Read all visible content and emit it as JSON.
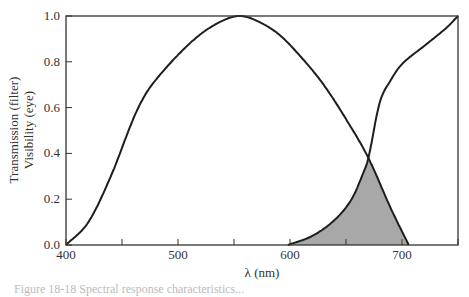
{
  "chart_data": {
    "type": "line",
    "title": "",
    "xlabel": "λ (nm)",
    "ylabel_line1": "Transmission (filter)",
    "ylabel_line2": "Visibility (eye)",
    "xlim": [
      400,
      750
    ],
    "ylim": [
      0.0,
      1.0
    ],
    "x_ticks": [
      400,
      450,
      500,
      550,
      600,
      650,
      700,
      750
    ],
    "x_tick_labels": [
      "400",
      "500",
      "600",
      "700"
    ],
    "x_tick_label_values": [
      400,
      500,
      600,
      700
    ],
    "y_ticks": [
      0.0,
      0.2,
      0.4,
      0.6,
      0.8,
      1.0
    ],
    "y_tick_labels": [
      "0.0",
      "0.2",
      "0.4",
      "0.6",
      "0.8",
      "1.0"
    ],
    "grid": false,
    "legend": null,
    "series": [
      {
        "name": "Visibility (eye)",
        "x": [
          400,
          420,
          440,
          460,
          470,
          480,
          500,
          520,
          540,
          555,
          570,
          590,
          610,
          630,
          650,
          670,
          690,
          706
        ],
        "values": [
          0.0,
          0.1,
          0.3,
          0.55,
          0.65,
          0.72,
          0.83,
          0.92,
          0.98,
          1.0,
          0.98,
          0.92,
          0.82,
          0.7,
          0.55,
          0.38,
          0.16,
          0.0
        ]
      },
      {
        "name": "Transmission (filter)",
        "x": [
          598,
          620,
          640,
          655,
          665,
          670,
          680,
          690,
          700,
          720,
          740,
          750
        ],
        "values": [
          0.0,
          0.04,
          0.11,
          0.2,
          0.31,
          0.38,
          0.62,
          0.72,
          0.79,
          0.87,
          0.95,
          1.0
        ]
      }
    ],
    "annotations": [
      {
        "type": "shaded_region",
        "description": "Overlap area under both curves (min of eye and filter), ~598–706 nm",
        "color": "#a8a8a8"
      }
    ],
    "intersection": {
      "x": 670,
      "y": 0.38
    }
  },
  "colors": {
    "line": "#1e1e1e",
    "fill": "#a8a8a8",
    "axis": "#333333"
  },
  "caption": "Figure 18-18 Spectral response characteristics..."
}
